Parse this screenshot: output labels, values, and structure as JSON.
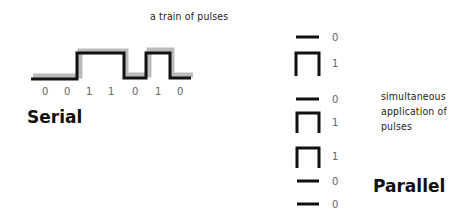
{
  "serial": {
    "title": "Serial",
    "caption": "a train of pulses",
    "bits": [
      "0",
      "0",
      "1",
      "1",
      "0",
      "1",
      "0"
    ]
  },
  "parallel": {
    "title": "Parallel",
    "caption_lines": [
      "simultaneous",
      "application of",
      "pulses"
    ],
    "bits": [
      "0",
      "1",
      "0",
      "1",
      "1",
      "0",
      "0"
    ]
  }
}
